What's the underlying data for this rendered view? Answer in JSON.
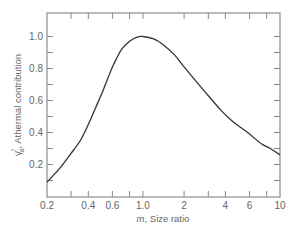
{
  "chart_data": {
    "type": "line",
    "title": "",
    "xlabel": "m, Size ratio",
    "xlabel_var": "m",
    "xlabel_rest": ", Size ratio",
    "ylabel": "γ̄ₐ°, Athermal contribution",
    "ylabel_symbol": "γ̄",
    "ylabel_sub": "a",
    "ylabel_sup": "°",
    "ylabel_rest": ", Athermal contribution",
    "x_scale": "log",
    "xlim": [
      0.2,
      10
    ],
    "ylim": [
      0,
      1.1
    ],
    "grid": false,
    "legend": null,
    "x_ticks": [
      0.2,
      0.3,
      0.4,
      0.6,
      0.8,
      1.0,
      2,
      3,
      4,
      6,
      8,
      10
    ],
    "x_tick_labels": [
      {
        "value": 0.2,
        "label": "0.2"
      },
      {
        "value": 0.4,
        "label": "0.4"
      },
      {
        "value": 0.6,
        "label": "0.6"
      },
      {
        "value": 1.0,
        "label": "1.0"
      },
      {
        "value": 2,
        "label": "2"
      },
      {
        "value": 4,
        "label": "4"
      },
      {
        "value": 6,
        "label": "6"
      },
      {
        "value": 10,
        "label": "10"
      }
    ],
    "y_ticks": [
      0.1,
      0.2,
      0.3,
      0.4,
      0.5,
      0.6,
      0.7,
      0.8,
      0.9,
      1.0
    ],
    "y_tick_labels": [
      {
        "value": 0.2,
        "label": "0.2"
      },
      {
        "value": 0.4,
        "label": "0.4"
      },
      {
        "value": 0.6,
        "label": "0.6"
      },
      {
        "value": 0.8,
        "label": "0.8"
      },
      {
        "value": 1.0,
        "label": "1.0"
      }
    ],
    "series": [
      {
        "name": "Athermal contribution",
        "color": "#333333",
        "x": [
          0.2,
          0.25,
          0.3,
          0.35,
          0.4,
          0.45,
          0.5,
          0.55,
          0.6,
          0.65,
          0.7,
          0.8,
          0.9,
          1.0,
          1.2,
          1.4,
          1.7,
          2.0,
          2.5,
          3.0,
          3.7,
          4.5,
          5.2,
          6.0,
          7.3,
          8.5,
          10.0
        ],
        "y": [
          0.09,
          0.18,
          0.27,
          0.35,
          0.45,
          0.55,
          0.64,
          0.73,
          0.81,
          0.87,
          0.92,
          0.97,
          0.995,
          1.0,
          0.985,
          0.95,
          0.885,
          0.81,
          0.71,
          0.63,
          0.54,
          0.47,
          0.43,
          0.39,
          0.33,
          0.3,
          0.26
        ]
      }
    ]
  }
}
